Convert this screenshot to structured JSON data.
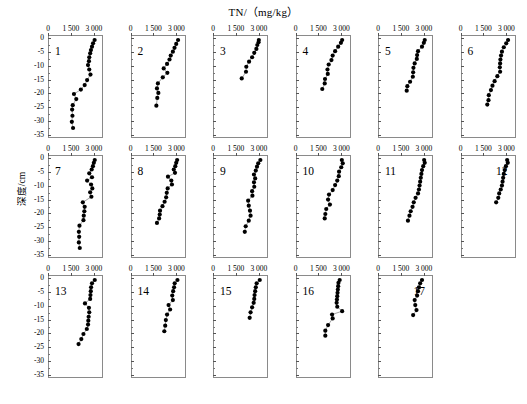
{
  "chart_data": {
    "type": "scatter",
    "title": "TN/（mg/kg）",
    "xlabel": "",
    "ylabel": "深度/cm",
    "xlim": [
      0,
      3600
    ],
    "ylim": [
      -36,
      1
    ],
    "xticks": [
      0,
      1500,
      3000
    ],
    "xtick_labels": [
      "0",
      "1 500",
      "3 000"
    ],
    "yticks": [
      0,
      -5,
      -10,
      -15,
      -20,
      -25,
      -30,
      -35
    ],
    "ytick_labels": [
      "0",
      "-5",
      "-10",
      "-15",
      "-20",
      "-25",
      "-30",
      "-35"
    ],
    "grid": false,
    "legend": "none",
    "panel_layout": {
      "rows": 3,
      "cols": 6,
      "empty_cells": [
        17
      ]
    },
    "panels": [
      {
        "label": "1",
        "label_side": "left",
        "x": [
          3050,
          2950,
          2880,
          2810,
          2760,
          2700,
          2680,
          2620,
          2700,
          2780,
          2560,
          2400,
          2150,
          1700,
          1850,
          1620,
          1580,
          1600,
          1560,
          1640
        ],
        "y": [
          -0.8,
          -2.0,
          -3.2,
          -4.4,
          -5.6,
          -7.0,
          -8.4,
          -9.8,
          -11.4,
          -13.2,
          -15.2,
          -17.0,
          -18.6,
          -20.2,
          -22.0,
          -24.2,
          -25.8,
          -28.0,
          -30.2,
          -32.4
        ]
      },
      {
        "label": "2",
        "label_side": "left",
        "x": [
          3080,
          2960,
          2850,
          2740,
          2600,
          2520,
          2360,
          2140,
          2380,
          2080,
          1760,
          1700,
          1790,
          1720,
          1660
        ],
        "y": [
          -0.8,
          -2.2,
          -3.6,
          -5.0,
          -6.4,
          -7.8,
          -9.4,
          -11.0,
          -12.6,
          -14.2,
          -16.4,
          -18.2,
          -19.8,
          -21.6,
          -24.4
        ]
      },
      {
        "label": "3",
        "label_side": "left",
        "x": [
          3000,
          2980,
          2900,
          2840,
          2700,
          2560,
          2360,
          2180,
          2160,
          1880
        ],
        "y": [
          -0.8,
          -1.6,
          -2.6,
          -4.0,
          -5.4,
          -7.0,
          -8.6,
          -10.4,
          -12.2,
          -14.6
        ]
      },
      {
        "label": "4",
        "label_side": "left",
        "x": [
          3020,
          2940,
          2760,
          2560,
          2400,
          2320,
          2140,
          2060,
          2080,
          1900,
          1880,
          1720
        ],
        "y": [
          -0.8,
          -1.8,
          -3.2,
          -4.8,
          -6.4,
          -8.0,
          -9.6,
          -11.4,
          -13.0,
          -14.8,
          -16.4,
          -18.4
        ]
      },
      {
        "label": "5",
        "label_side": "left",
        "x": [
          3060,
          3000,
          2880,
          2620,
          2560,
          2540,
          2400,
          2320,
          2300,
          2280,
          2100,
          1920,
          1880
        ],
        "y": [
          -0.8,
          -1.8,
          -3.2,
          -4.8,
          -6.2,
          -7.6,
          -9.2,
          -10.8,
          -12.4,
          -14.0,
          -15.8,
          -17.4,
          -19.0
        ]
      },
      {
        "label": "6",
        "label_side": "left",
        "x": [
          3080,
          2960,
          2800,
          2680,
          2620,
          2580,
          2560,
          2540,
          2560,
          2380,
          2200,
          2060,
          1960,
          1820,
          1800,
          1720
        ],
        "y": [
          -0.8,
          -2.0,
          -3.4,
          -5.0,
          -6.4,
          -7.8,
          -9.2,
          -10.6,
          -12.2,
          -13.8,
          -15.6,
          -17.2,
          -18.8,
          -20.6,
          -22.4,
          -24.0
        ]
      },
      {
        "label": "7",
        "label_side": "left",
        "x": [
          3060,
          3000,
          2940,
          2860,
          2700,
          2880,
          2560,
          2820,
          2900,
          2760,
          2840,
          2280,
          2400,
          2380,
          2340,
          2320,
          2060,
          2020,
          2040,
          2020,
          2080
        ],
        "y": [
          -0.8,
          -1.8,
          -3.0,
          -4.2,
          -5.6,
          -7.0,
          -8.2,
          -9.6,
          -11.0,
          -12.4,
          -14.0,
          -16.0,
          -17.6,
          -19.2,
          -20.8,
          -22.4,
          -24.4,
          -26.6,
          -28.4,
          -30.4,
          -32.4
        ]
      },
      {
        "label": "8",
        "label_side": "left",
        "x": [
          3020,
          2960,
          2900,
          2800,
          2880,
          2420,
          2640,
          2680,
          2400,
          2340,
          2300,
          2200,
          2060,
          1900,
          1880,
          1840,
          1700
        ],
        "y": [
          -0.8,
          -1.8,
          -3.0,
          -4.2,
          -5.4,
          -6.8,
          -8.2,
          -9.6,
          -11.0,
          -12.6,
          -14.2,
          -15.8,
          -17.4,
          -19.0,
          -20.4,
          -21.8,
          -23.4
        ]
      },
      {
        "label": "9",
        "label_side": "left",
        "x": [
          3100,
          2960,
          2880,
          2800,
          2680,
          2760,
          2680,
          2700,
          2560,
          2580,
          2300,
          2340,
          2420,
          2460,
          2340,
          2140,
          2080
        ],
        "y": [
          -0.8,
          -2.0,
          -3.2,
          -4.6,
          -6.0,
          -7.4,
          -8.8,
          -10.4,
          -12.0,
          -13.6,
          -15.4,
          -17.2,
          -19.0,
          -20.8,
          -22.6,
          -24.6,
          -26.6
        ]
      },
      {
        "label": "10",
        "label_side": "left",
        "x": [
          3000,
          3060,
          2960,
          2820,
          2800,
          2700,
          2560,
          2400,
          2160,
          2100,
          2220,
          1980,
          1920,
          1880
        ],
        "y": [
          -0.8,
          -2.0,
          -3.4,
          -5.0,
          -6.6,
          -8.2,
          -9.8,
          -11.6,
          -13.2,
          -15.0,
          -16.8,
          -18.4,
          -20.2,
          -21.8
        ]
      },
      {
        "label": "11",
        "label_side": "left",
        "x": [
          3020,
          3060,
          2960,
          2880,
          2840,
          2800,
          2760,
          2720,
          2680,
          2620,
          2460,
          2340,
          2260,
          2140,
          2060,
          1960
        ],
        "y": [
          -0.8,
          -1.8,
          -3.0,
          -4.4,
          -5.8,
          -7.2,
          -8.6,
          -10.0,
          -11.4,
          -12.8,
          -14.4,
          -16.0,
          -17.6,
          -19.2,
          -20.8,
          -22.6
        ]
      },
      {
        "label": "12",
        "label_side": "right",
        "x": [
          3020,
          3060,
          2940,
          2860,
          2800,
          2760,
          2720,
          2680,
          2600,
          2500,
          2440,
          2300
        ],
        "y": [
          -0.8,
          -1.8,
          -3.0,
          -4.4,
          -5.8,
          -7.2,
          -8.6,
          -10.0,
          -11.4,
          -12.8,
          -14.4,
          -16.0
        ]
      },
      {
        "label": "13",
        "label_side": "left",
        "x": [
          3060,
          2880,
          2820,
          2800,
          2780,
          2760,
          2420,
          2680,
          2700,
          2660,
          2640,
          2620,
          2540,
          2320,
          2180,
          2000
        ],
        "y": [
          -0.8,
          -2.0,
          -3.4,
          -4.8,
          -6.2,
          -7.6,
          -9.2,
          -10.8,
          -12.4,
          -14.0,
          -15.4,
          -16.8,
          -18.4,
          -20.2,
          -22.0,
          -23.8
        ]
      },
      {
        "label": "14",
        "label_side": "left",
        "x": [
          3040,
          2860,
          2820,
          2760,
          2700,
          2740,
          2460,
          2560,
          2360,
          2280,
          2240,
          2180
        ],
        "y": [
          -0.8,
          -2.0,
          -3.4,
          -4.8,
          -6.4,
          -8.0,
          -9.8,
          -11.4,
          -13.2,
          -15.2,
          -17.2,
          -19.2
        ]
      },
      {
        "label": "15",
        "label_side": "left",
        "x": [
          3060,
          2860,
          2800,
          2760,
          2720,
          2700,
          2660,
          2560,
          2460,
          2400
        ],
        "y": [
          -0.8,
          -2.0,
          -3.4,
          -4.8,
          -6.2,
          -7.6,
          -9.0,
          -10.6,
          -12.4,
          -14.4
        ]
      },
      {
        "label": "16",
        "label_side": "left",
        "x": [
          2860,
          2780,
          2760,
          2740,
          2720,
          2700,
          2680,
          2660,
          2700,
          3020,
          2360,
          2400,
          2100,
          1920,
          1920
        ],
        "y": [
          -0.8,
          -1.8,
          -3.0,
          -4.2,
          -5.4,
          -6.6,
          -7.8,
          -9.0,
          -10.4,
          -12.0,
          -13.2,
          -14.6,
          -17.0,
          -19.0,
          -20.8
        ]
      },
      {
        "label": "17",
        "label_side": "right",
        "x": [
          2880,
          2760,
          2680,
          2620,
          2560,
          2400,
          2440,
          2520,
          2300
        ],
        "y": [
          -0.8,
          -2.0,
          -3.4,
          -4.8,
          -6.4,
          -8.0,
          -9.8,
          -11.6,
          -13.4
        ]
      }
    ]
  }
}
